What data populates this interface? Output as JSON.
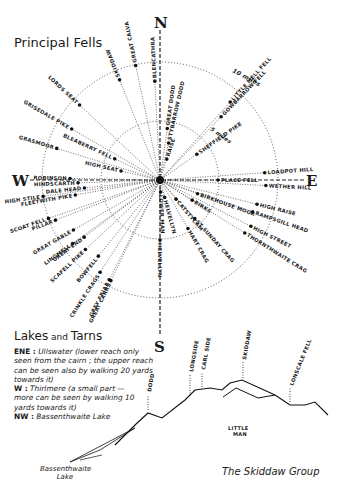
{
  "title": "Principal Fells",
  "compass": {
    "north": "N",
    "south": "S",
    "east": "E",
    "west": "W"
  },
  "rings": {
    "outer_label": "10 miles",
    "inner_label": "5 miles"
  },
  "fells": [
    {
      "name": "SKIDDAW",
      "angle": -22,
      "dist": 108
    },
    {
      "name": "GREAT CALVA",
      "angle": -12,
      "dist": 117
    },
    {
      "name": "BLENCATHRA",
      "angle": -3,
      "dist": 99
    },
    {
      "name": "GREAT DODD",
      "angle": 8,
      "dist": 52
    },
    {
      "name": "STYBARROW DODD",
      "angle": 13,
      "dist": 38
    },
    {
      "name": "RAISE",
      "angle": 18,
      "dist": 22
    },
    {
      "name": "LITTLE MELL FELL",
      "angle": 42,
      "dist": 105
    },
    {
      "name": "GOWBARROW FELL",
      "angle": 44,
      "dist": 88
    },
    {
      "name": "SHEFFIELD PIKE",
      "angle": 55,
      "dist": 45
    },
    {
      "name": "LOADPOT HILL",
      "angle": 86,
      "dist": 105
    },
    {
      "name": "PLACE FELL",
      "angle": 90,
      "dist": 58
    },
    {
      "name": "WETHER HILL",
      "angle": 93,
      "dist": 106
    },
    {
      "name": "BIRKHOUSE MOOR",
      "angle": 110,
      "dist": 40
    },
    {
      "name": "HIGH RAISE",
      "angle": 104,
      "dist": 100
    },
    {
      "name": "RAMPSGILL HEAD",
      "angle": 109,
      "dist": 98
    },
    {
      "name": "BIRKS",
      "angle": 122,
      "dist": 38
    },
    {
      "name": "HIGH STREET",
      "angle": 117,
      "dist": 102
    },
    {
      "name": "THORNTHWAITE CRAG",
      "angle": 122,
      "dist": 100
    },
    {
      "name": "CATSTYCAM",
      "angle": 140,
      "dist": 25
    },
    {
      "name": "ST SUNDAY CRAG",
      "angle": 138,
      "dist": 52
    },
    {
      "name": "HART CRAG",
      "angle": 150,
      "dist": 56
    },
    {
      "name": "HELVELLYN",
      "angle": 165,
      "dist": 18
    },
    {
      "name": "LOWER MAN",
      "angle": 177,
      "dist": 12
    },
    {
      "name": "HELVELLYN",
      "angle": 180,
      "dist": 60
    },
    {
      "name": "GREAT CARRS",
      "angle": 206,
      "dist": 112
    },
    {
      "name": "GREY FRIAR",
      "angle": 207,
      "dist": 112
    },
    {
      "name": "CRINKLE CRAGS",
      "angle": 213,
      "dist": 110
    },
    {
      "name": "BOWFELL",
      "angle": 219,
      "dist": 98
    },
    {
      "name": "SCAFELL PIKE",
      "angle": 227,
      "dist": 102
    },
    {
      "name": "GREAT END",
      "angle": 233,
      "dist": 95
    },
    {
      "name": "LINGMELL",
      "angle": 234,
      "dist": 108
    },
    {
      "name": "GREAT GABLE",
      "angle": 240,
      "dist": 100
    },
    {
      "name": "SCOAT FELL",
      "angle": 251,
      "dist": 118
    },
    {
      "name": "PILLAR",
      "angle": 249,
      "dist": 112
    },
    {
      "name": "FLEETWITH PIKE",
      "angle": 260,
      "dist": 86
    },
    {
      "name": "DALE HEAD",
      "angle": 264,
      "dist": 76
    },
    {
      "name": "HIGH STILE",
      "angle": 262,
      "dist": 118
    },
    {
      "name": "HINDSCARTH",
      "angle": 268,
      "dist": 82
    },
    {
      "name": "ROBINSON",
      "angle": 271,
      "dist": 90
    },
    {
      "name": "HIGH SEAT",
      "angle": 283,
      "dist": 40
    },
    {
      "name": "GRASMOOR",
      "angle": 287,
      "dist": 108
    },
    {
      "name": "BLEABERRY FELL",
      "angle": 295,
      "dist": 50
    },
    {
      "name": "GRISEDALE PIKE",
      "angle": 300,
      "dist": 102
    },
    {
      "name": "LORDS SEAT",
      "angle": 313,
      "dist": 110
    }
  ],
  "lakes": {
    "heading_big": "Lakes",
    "heading_small": " and ",
    "heading_end": "Tarns",
    "entries": [
      {
        "dir": "ENE :",
        "text": "Ullswater (lower reach only seen from the cairn ; the upper reach can be seen also by walking 20 yards towards it)"
      },
      {
        "dir": "W :",
        "text": "Thirlmere (a small part — more can be seen by walking 10 yards towards it)"
      },
      {
        "dir": "NW :",
        "text": "Bassenthwaite Lake"
      }
    ]
  },
  "profile": {
    "title": "The Skiddaw Group",
    "lake_label": "Bassenthwaite Lake",
    "peaks": [
      "DODD",
      "LONGSIDE",
      "CARL SIDE",
      "SKIDDAW",
      "LONSCALE FELL"
    ],
    "little_man": "LITTLE MAN"
  }
}
